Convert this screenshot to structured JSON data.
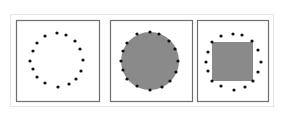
{
  "diagram": {
    "colors": {
      "panel_border": "#6f6f6f",
      "outer_border": "#e6e6e6",
      "fill": "#8a8a8a",
      "dot": "#111111",
      "background": "#ffffff"
    },
    "panels": [
      {
        "id": "panel-empty",
        "x": 16,
        "y": 20,
        "w": 83,
        "h": 81,
        "shape": "none",
        "dots": [
          [
            57,
            33
          ],
          [
            66,
            35
          ],
          [
            75,
            41
          ],
          [
            80,
            49
          ],
          [
            83,
            60
          ],
          [
            81,
            71
          ],
          [
            76,
            79
          ],
          [
            69,
            84
          ],
          [
            58,
            87
          ],
          [
            45,
            83
          ],
          [
            37,
            77
          ],
          [
            33,
            69
          ],
          [
            30,
            61
          ],
          [
            33,
            51
          ],
          [
            37,
            43
          ],
          [
            45,
            36
          ]
        ]
      },
      {
        "id": "panel-circle",
        "x": 110,
        "y": 20,
        "w": 82,
        "h": 81,
        "shape": "circle",
        "circle": {
          "cx": 150,
          "cy": 61,
          "r": 29
        },
        "dots": [
          [
            150,
            32
          ],
          [
            159,
            34
          ],
          [
            169,
            41
          ],
          [
            175,
            49
          ],
          [
            178,
            61
          ],
          [
            176,
            72
          ],
          [
            170,
            81
          ],
          [
            162,
            87
          ],
          [
            150,
            90
          ],
          [
            137,
            86
          ],
          [
            127,
            79
          ],
          [
            123,
            70
          ],
          [
            121,
            61
          ],
          [
            123,
            51
          ],
          [
            127,
            43
          ],
          [
            137,
            34
          ]
        ]
      },
      {
        "id": "panel-square",
        "x": 197,
        "y": 20,
        "w": 71,
        "h": 81,
        "shape": "square",
        "square": {
          "x": 212,
          "y": 42,
          "w": 41,
          "h": 39
        },
        "dots": [
          [
            233,
            34
          ],
          [
            242,
            35
          ],
          [
            252,
            41
          ],
          [
            258,
            50
          ],
          [
            261,
            62
          ],
          [
            258,
            72
          ],
          [
            253,
            81
          ],
          [
            245,
            87
          ],
          [
            234,
            90
          ],
          [
            221,
            86
          ],
          [
            212,
            81
          ],
          [
            208,
            71
          ],
          [
            206,
            62
          ],
          [
            208,
            52
          ],
          [
            212,
            42
          ],
          [
            221,
            36
          ]
        ]
      }
    ]
  }
}
